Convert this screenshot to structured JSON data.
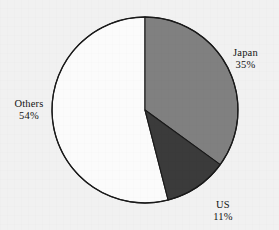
{
  "figure": {
    "name": "market-share-pie-chart",
    "background_color": "#f1f1f1",
    "outline_color": "#1a1a1a"
  },
  "chart_data": {
    "type": "pie",
    "title": "",
    "subtitle": "",
    "xlabel": "",
    "ylabel": "",
    "legend_position": "none",
    "grid": false,
    "labels_inline": true,
    "start_angle_deg": 0,
    "direction": "clockwise",
    "categories": [
      "Japan",
      "US",
      "Others"
    ],
    "values": [
      35,
      11,
      54
    ],
    "value_unit": "%",
    "slices": [
      {
        "label": "Japan",
        "value": 35,
        "value_text": "35%",
        "color": "#808080",
        "start_angle_deg": 0,
        "end_angle_deg": 126
      },
      {
        "label": "US",
        "value": 11,
        "value_text": "11%",
        "color": "#3b3b3b",
        "start_angle_deg": 126,
        "end_angle_deg": 165.6
      },
      {
        "label": "Others",
        "value": 54,
        "value_text": "54%",
        "color": "#fbfbfb",
        "start_angle_deg": 165.6,
        "end_angle_deg": 360
      }
    ],
    "annotations": [
      {
        "name": "Japan",
        "value_text": "35%"
      },
      {
        "name": "US",
        "value_text": "11%"
      },
      {
        "name": "Others",
        "value_text": "54%"
      }
    ]
  },
  "labels": {
    "japan": {
      "name": "Japan",
      "value": "35%"
    },
    "us": {
      "name": "US",
      "value": "11%"
    },
    "others": {
      "name": "Others",
      "value": "54%"
    }
  }
}
